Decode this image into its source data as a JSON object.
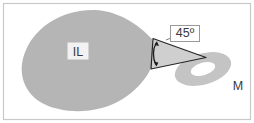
{
  "figure": {
    "type": "technical-diagram",
    "background_color": "#ffffff",
    "frame": {
      "name": "figure-border",
      "stroke_color": "#c9c9c9",
      "stroke_width": 1.2,
      "x": 3,
      "y": 3,
      "width": 248,
      "height": 117
    },
    "shapes": {
      "lobe": {
        "label": "IL",
        "description": "large teardrop / pear shaped region",
        "fill_color": "#b5b5b5"
      },
      "wedge": {
        "description": "triangular wedge with apex at right",
        "fill_color": "#cfcfcf",
        "outline_color": "#262626"
      },
      "annulus": {
        "label": "M",
        "description": "elliptical ring / annulus tilted",
        "fill_color": "#c4c4c4"
      }
    },
    "angle_marker": {
      "name": "angle-arc",
      "value": "45º",
      "arc_color": "#1c1c1c",
      "label_box_fill": "#ffffff",
      "label_box_stroke": "#9a9a9a"
    },
    "labels": {
      "lobe_label": "IL",
      "lobe_label_box_fill": "#f2f2f2",
      "angle_label": "45º",
      "annulus_label": "M",
      "label_text_color": "#3a3a3a"
    }
  }
}
